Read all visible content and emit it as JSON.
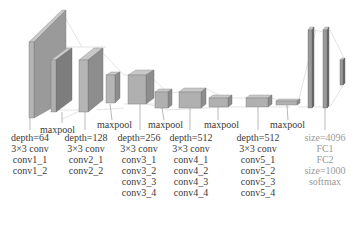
{
  "diagram": {
    "type": "VGG network architecture",
    "colors": {
      "front": "#a9a9a9",
      "side": "#7d7d7d",
      "top": "#c8c8c8",
      "edge": "#6a6a6a",
      "connector": "#cfcfcf",
      "text": "#3a3a3a",
      "fc_text": "#9a9a9a"
    },
    "maxpool_labels": [
      "maxpool",
      "maxpool",
      "maxpool",
      "maxpool",
      "maxpool"
    ],
    "blocks": [
      {
        "lines": [
          "depth=64",
          "3×3 conv",
          "conv1_1",
          "conv1_2"
        ]
      },
      {
        "lines": [
          "depth=128",
          "3×3 conv",
          "conv2_1",
          "conv2_2"
        ]
      },
      {
        "lines": [
          "depth=256",
          "3×3 conv",
          "conv3_1",
          "conv3_2",
          "conv3_3",
          "conv3_4"
        ]
      },
      {
        "lines": [
          "depth=512",
          "3×3 conv",
          "conv4_1",
          "conv4_2",
          "conv4_3",
          "conv4_4"
        ]
      },
      {
        "lines": [
          "depth=512",
          "3×3 conv",
          "conv5_1",
          "conv5_2",
          "conv5_3",
          "conv5_4"
        ]
      }
    ],
    "fc_block": {
      "lines": [
        "size=4096",
        "FC1",
        "FC2",
        "size=1000",
        "softmax"
      ]
    }
  }
}
